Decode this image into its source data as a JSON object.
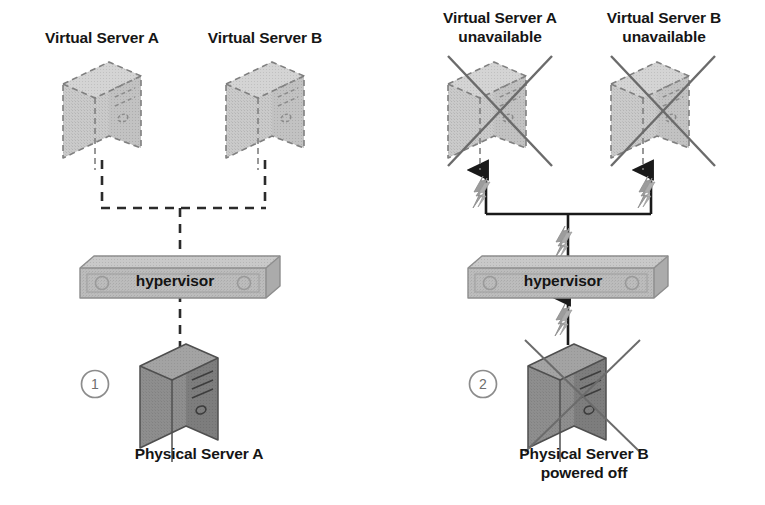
{
  "diagram": {
    "background_color": "#ffffff",
    "colors": {
      "virtual_server_fill": "#c9c9c9",
      "virtual_server_stroke": "#8a8a8a",
      "physical_server_fill": "#8d8d8d",
      "physical_server_top": "#a2a2a2",
      "physical_server_side": "#7b7b7b",
      "hypervisor_fill": "#b8b8b8",
      "hypervisor_top": "#c7c7c7",
      "hypervisor_stroke": "#8f8f8f",
      "line_dashed": "#2b2b2b",
      "line_solid": "#1a1a1a",
      "cross_out": "#6b6b6b",
      "bolt_fill": "#9a9a9a",
      "text": "#151515",
      "step_circle": "#8c8c8c"
    }
  },
  "panels": [
    {
      "id": "panel-1",
      "step_number": "1",
      "virtual_servers": [
        {
          "id": "vs-a",
          "label": "Virtual Server A",
          "state": "available"
        },
        {
          "id": "vs-b",
          "label": "Virtual Server B",
          "state": "available"
        }
      ],
      "hypervisor": {
        "label": "hypervisor"
      },
      "physical_server": {
        "label": "Physical Server A",
        "state": "powered on"
      },
      "connections": {
        "style": "dashed",
        "fault_bolts": 0
      }
    },
    {
      "id": "panel-2",
      "step_number": "2",
      "virtual_servers": [
        {
          "id": "vs-a2",
          "label": "Virtual Server A\nunavailable",
          "state": "unavailable"
        },
        {
          "id": "vs-b2",
          "label": "Virtual Server B\nunavailable",
          "state": "unavailable"
        }
      ],
      "hypervisor": {
        "label": "hypervisor"
      },
      "physical_server": {
        "label": "Physical Server B\npowered off",
        "state": "powered off"
      },
      "connections": {
        "style": "solid",
        "fault_bolts": 3
      }
    }
  ]
}
